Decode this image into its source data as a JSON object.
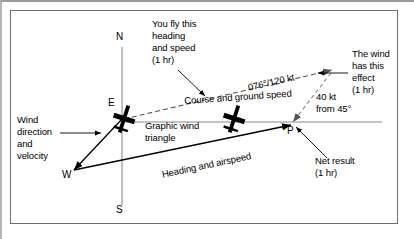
{
  "figure": {
    "type": "aviation-wind-triangle"
  },
  "compass": {
    "north": "N",
    "east": "E",
    "south": "S",
    "west": "W"
  },
  "points": {
    "p": "P"
  },
  "annotations": {
    "you_fly": "You fly this\nheading\nand speed\n(1 hr)",
    "you_fly_line1": "You fly this",
    "you_fly_line2": "heading",
    "you_fly_line3": "and speed",
    "you_fly_line4": "(1 hr)",
    "course_ground_speed": "Course and ground speed",
    "course_value": "076°/120 kt",
    "wind_effect_line1": "The wind",
    "wind_effect_line2": "has this",
    "wind_effect_line3": "effect",
    "wind_effect_line4": "(1 hr)",
    "wind_value_line1": "40 kt",
    "wind_value_line2": "from 45°",
    "wind_dir_line1": "Wind",
    "wind_dir_line2": "direction",
    "wind_dir_line3": "and",
    "wind_dir_line4": "velocity",
    "graphic_wind_line1": "Graphic wind",
    "graphic_wind_line2": "triangle",
    "heading_airspeed": "Heading and airspeed",
    "net_result_line1": "Net result",
    "net_result_line2": "(1 hr)"
  },
  "values": {
    "course": "076°",
    "ground_speed": "120 kt",
    "wind_speed": "40 kt",
    "wind_from": "45°",
    "time_interval": "1 hr"
  },
  "colors": {
    "ink": "#000000",
    "frame": "#6e6e6e",
    "page_edge": "#9a9a9a",
    "background": "#ffffff"
  }
}
